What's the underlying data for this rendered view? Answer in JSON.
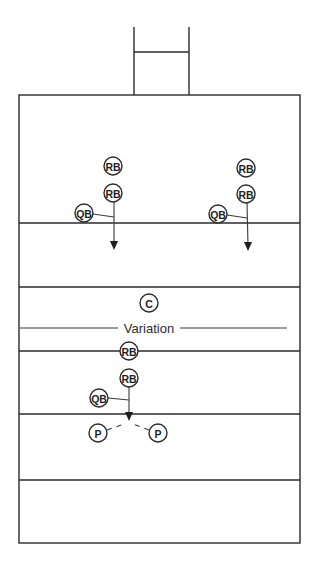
{
  "colors": {
    "stroke": "#2b2b2b",
    "background": "#ffffff"
  },
  "goalpost": {
    "left_x": 134,
    "right_x": 189,
    "top_y": 27,
    "crossbar_y": 52,
    "base_y": 95
  },
  "field": {
    "left": 19,
    "right": 300,
    "top": 95,
    "bottom": 543
  },
  "yard_lines": [
    223,
    287,
    351,
    414,
    480
  ],
  "variation": {
    "label": "Variation",
    "y": 328,
    "line_left": [
      20,
      118
    ],
    "line_right": [
      180,
      287
    ]
  },
  "players": [
    {
      "label": "RB",
      "x": 113,
      "y": 166,
      "r": 9
    },
    {
      "label": "RB",
      "x": 113,
      "y": 193,
      "r": 9
    },
    {
      "label": "QB",
      "x": 84,
      "y": 213,
      "r": 9
    },
    {
      "label": "RB",
      "x": 246,
      "y": 168,
      "r": 9
    },
    {
      "label": "RB",
      "x": 246,
      "y": 194,
      "r": 9
    },
    {
      "label": "QB",
      "x": 218,
      "y": 214,
      "r": 9
    },
    {
      "label": "C",
      "x": 149,
      "y": 303,
      "r": 9
    },
    {
      "label": "RB",
      "x": 129,
      "y": 351,
      "r": 9
    },
    {
      "label": "RB",
      "x": 129,
      "y": 378,
      "r": 9
    },
    {
      "label": "QB",
      "x": 99,
      "y": 398,
      "r": 9
    },
    {
      "label": "P",
      "x": 98,
      "y": 433,
      "r": 9
    },
    {
      "label": "P",
      "x": 158,
      "y": 433,
      "r": 9
    }
  ],
  "paths": [
    {
      "type": "arrow",
      "from": [
        114,
        202
      ],
      "to": [
        114,
        250
      ]
    },
    {
      "type": "line",
      "from": [
        93,
        214
      ],
      "to": [
        114,
        217
      ]
    },
    {
      "type": "arrow",
      "from": [
        247,
        203
      ],
      "to": [
        248,
        251
      ]
    },
    {
      "type": "line",
      "from": [
        227,
        215
      ],
      "to": [
        247,
        218
      ]
    },
    {
      "type": "arrow",
      "from": [
        129,
        387
      ],
      "to": [
        129,
        421
      ]
    },
    {
      "type": "line",
      "from": [
        108,
        398
      ],
      "to": [
        129,
        400
      ]
    },
    {
      "type": "dash",
      "from": [
        107,
        430
      ],
      "to": [
        124,
        424
      ]
    },
    {
      "type": "dash",
      "from": [
        149,
        430
      ],
      "to": [
        133,
        424
      ]
    }
  ]
}
